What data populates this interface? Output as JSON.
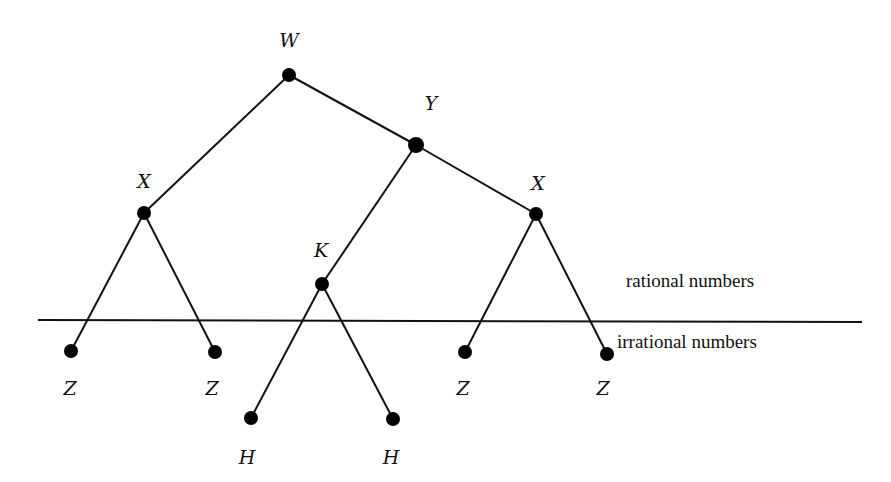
{
  "diagram": {
    "type": "tree",
    "nodes": [
      {
        "id": "w",
        "label": "W",
        "x": 289,
        "y": 75,
        "r": 7,
        "lx": 289,
        "ly": 40
      },
      {
        "id": "y",
        "label": "Y",
        "x": 416,
        "y": 145,
        "r": 8,
        "lx": 431,
        "ly": 103
      },
      {
        "id": "x1",
        "label": "X",
        "x": 144,
        "y": 213,
        "r": 7,
        "lx": 144,
        "ly": 181
      },
      {
        "id": "x2",
        "label": "X",
        "x": 536,
        "y": 214,
        "r": 7,
        "lx": 538,
        "ly": 183
      },
      {
        "id": "k",
        "label": "K",
        "x": 322,
        "y": 284,
        "r": 7,
        "lx": 321,
        "ly": 250
      },
      {
        "id": "z1",
        "label": "Z",
        "x": 71,
        "y": 351,
        "r": 7,
        "lx": 70,
        "ly": 388
      },
      {
        "id": "z2",
        "label": "Z",
        "x": 215,
        "y": 352,
        "r": 7,
        "lx": 212,
        "ly": 388
      },
      {
        "id": "h1",
        "label": "H",
        "x": 251,
        "y": 418,
        "r": 7,
        "lx": 247,
        "ly": 457
      },
      {
        "id": "h2",
        "label": "H",
        "x": 393,
        "y": 419,
        "r": 7,
        "lx": 391,
        "ly": 457
      },
      {
        "id": "z3",
        "label": "Z",
        "x": 465,
        "y": 352,
        "r": 7,
        "lx": 463,
        "ly": 388
      },
      {
        "id": "z4",
        "label": "Z",
        "x": 607,
        "y": 354,
        "r": 7,
        "lx": 603,
        "ly": 388
      }
    ],
    "edges": [
      [
        "w",
        "x1"
      ],
      [
        "w",
        "y"
      ],
      [
        "y",
        "k"
      ],
      [
        "y",
        "x2"
      ],
      [
        "x1",
        "z1"
      ],
      [
        "x1",
        "z2"
      ],
      [
        "k",
        "h1"
      ],
      [
        "k",
        "h2"
      ],
      [
        "x2",
        "z3"
      ],
      [
        "x2",
        "z4"
      ]
    ],
    "divider": {
      "x1": 38,
      "y1": 320,
      "x2": 862,
      "y2": 322
    },
    "regions": {
      "above": {
        "label": "rational numbers",
        "x": 626,
        "y": 282
      },
      "below": {
        "label": "irrational numbers",
        "x": 617,
        "y": 343
      }
    }
  }
}
